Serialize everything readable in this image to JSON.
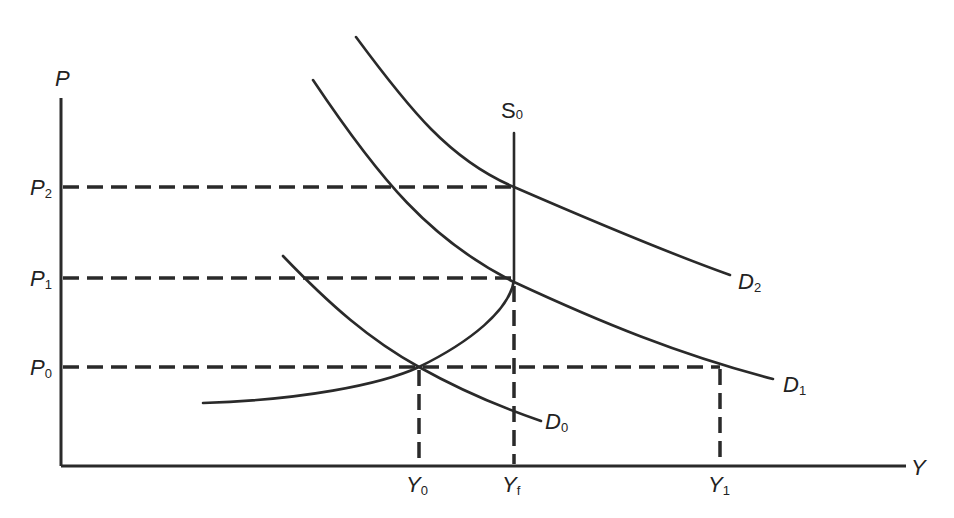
{
  "diagram": {
    "type": "supply-demand",
    "axes": {
      "y_axis": {
        "label": "P"
      },
      "x_axis": {
        "label": "Y"
      }
    },
    "price_levels": [
      {
        "label": "P",
        "sub": "2"
      },
      {
        "label": "P",
        "sub": "1"
      },
      {
        "label": "P",
        "sub": "0"
      }
    ],
    "output_levels": [
      {
        "label": "Y",
        "sub": "0"
      },
      {
        "label": "Y",
        "sub": "f"
      },
      {
        "label": "Y",
        "sub": "1"
      }
    ],
    "curves": {
      "supply": {
        "label": "S",
        "sub": "0"
      },
      "demand": [
        {
          "label": "D",
          "sub": "0"
        },
        {
          "label": "D",
          "sub": "1"
        },
        {
          "label": "D",
          "sub": "2"
        }
      ]
    },
    "colors": {
      "ink": "#2a2a2a",
      "background": "#ffffff"
    }
  }
}
